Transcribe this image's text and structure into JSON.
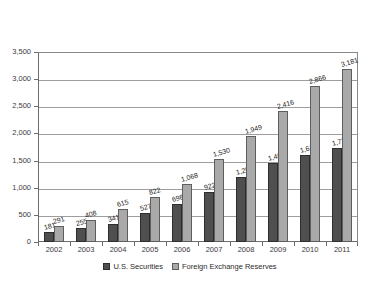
{
  "chart_data": {
    "type": "bar",
    "title": "",
    "subtitle": "",
    "xlabel": "",
    "ylabel": "",
    "categories": [
      "2002",
      "2003",
      "2004",
      "2005",
      "2006",
      "2007",
      "2008",
      "2009",
      "2010",
      "2011"
    ],
    "series": [
      {
        "name": "U.S. Securities",
        "color": "#4f4f4f",
        "values": [
          181,
          255,
          341,
          527,
          698,
          922,
          1205,
          1464,
          1611,
          1727
        ],
        "labels": [
          "181",
          "255",
          "341",
          "527",
          "698",
          "922",
          "1,205",
          "1,464",
          "1,611",
          "1,727"
        ]
      },
      {
        "name": "Foreign Exchange Reserves",
        "color": "#a9a9a9",
        "values": [
          291,
          408,
          615,
          822,
          1068,
          1530,
          1949,
          2416,
          2866,
          3181
        ],
        "labels": [
          "291",
          "408",
          "615",
          "822",
          "1,068",
          "1,530",
          "1,949",
          "2,416",
          "2,866",
          "3,181"
        ]
      }
    ],
    "ylim": [
      0,
      3500
    ],
    "ytick_values": [
      0,
      500,
      1000,
      1500,
      2000,
      2500,
      3000,
      3500
    ],
    "ytick_labels": [
      "0",
      "500",
      "1,000",
      "1,500",
      "2,000",
      "2,500",
      "3,000",
      "3,500"
    ],
    "grid": true,
    "grid_axis": "y",
    "legend_position": "bottom-center",
    "bar_mode": "grouped",
    "data_labels": true
  },
  "legend": {
    "items": [
      {
        "label": "U.S. Securities",
        "swatch": "dark-gray"
      },
      {
        "label": "Foreign Exchange Reserves",
        "swatch": "light-gray"
      }
    ]
  }
}
